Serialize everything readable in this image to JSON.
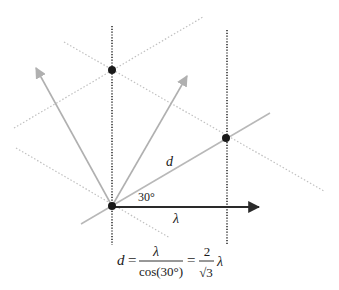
{
  "diagram": {
    "title": "",
    "colors": {
      "background": "#ffffff",
      "dot": "#1a1a1a",
      "black_arrow": "#2a2a2a",
      "gray_line": "#b5b5b5",
      "dotted_gray": "#bdbdbd",
      "dotted_black": "#333333"
    },
    "points": {
      "origin": {
        "x": 112,
        "y": 206
      },
      "top": {
        "x": 112,
        "y": 70
      },
      "right": {
        "x": 226,
        "y": 138
      }
    },
    "labels": {
      "d": "d",
      "angle": "30°",
      "lambda": "λ"
    },
    "formula": {
      "lhs": "d",
      "eq1": "=",
      "frac1_num": "λ",
      "frac1_den": "cos(30°)",
      "eq2": "=",
      "frac2_num": "2",
      "frac2_den": "√3",
      "tail": "λ"
    }
  }
}
